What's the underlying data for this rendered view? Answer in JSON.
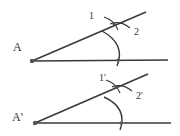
{
  "diagram": {
    "colors": {
      "line": "#3a3a3a",
      "point": "#555555",
      "background": "#ffffff"
    },
    "figures": [
      {
        "name": "original-angle",
        "vertex_label": "A",
        "arc_labels": [
          "1",
          "2"
        ],
        "vertex": [
          32,
          61
        ],
        "horizontal_end": [
          168,
          60
        ],
        "ray_end": [
          146,
          12
        ],
        "intersection": [
          114,
          24
        ],
        "arc_base": [
          118,
          60
        ]
      },
      {
        "name": "copied-angle",
        "vertex_label": "A'",
        "arc_labels": [
          "1'",
          "2'"
        ],
        "vertex": [
          35,
          123
        ],
        "horizontal_end": [
          171,
          123
        ],
        "ray_end": [
          148,
          74
        ],
        "intersection": [
          116,
          87
        ],
        "arc_base": [
          121,
          123
        ]
      }
    ]
  }
}
